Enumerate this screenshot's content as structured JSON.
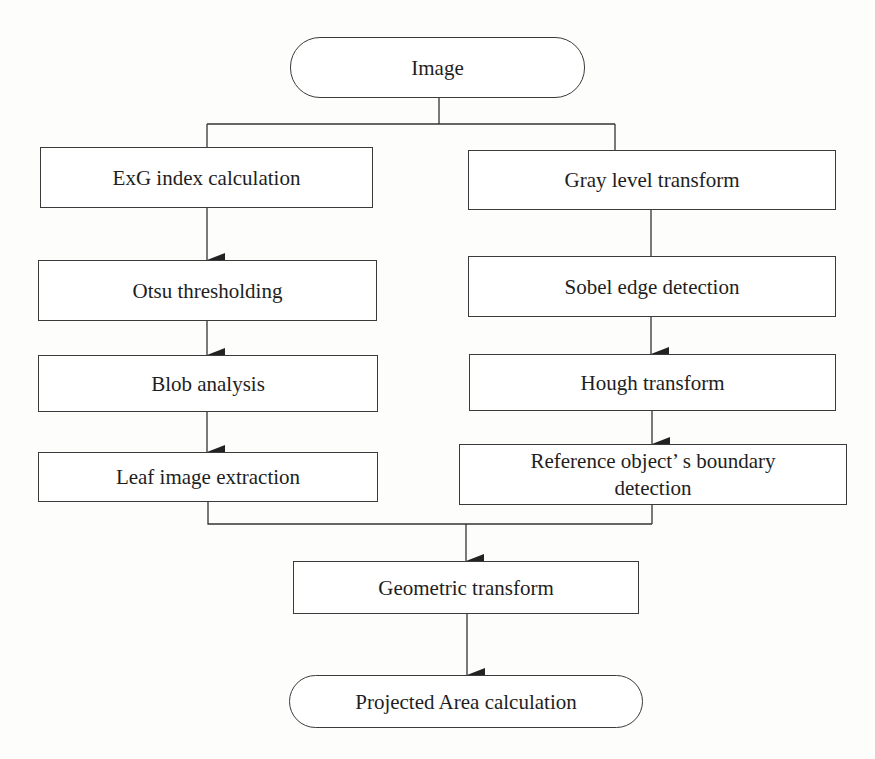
{
  "diagram": {
    "type": "flowchart",
    "nodes": {
      "image": {
        "label": "Image",
        "shape": "terminal"
      },
      "exg": {
        "label": "ExG index calculation",
        "shape": "process"
      },
      "otsu": {
        "label": "Otsu thresholding",
        "shape": "process"
      },
      "blob": {
        "label": "Blob analysis",
        "shape": "process"
      },
      "leaf": {
        "label": "Leaf image extraction",
        "shape": "process"
      },
      "gray": {
        "label": "Gray level transform",
        "shape": "process"
      },
      "sobel": {
        "label": "Sobel edge detection",
        "shape": "process"
      },
      "hough": {
        "label": "Hough transform",
        "shape": "process"
      },
      "reference_line1": {
        "label": "Reference object’ s boundary",
        "shape": "process"
      },
      "reference_line2": {
        "label": "detection",
        "shape": "process"
      },
      "geometric": {
        "label": "Geometric transform",
        "shape": "process"
      },
      "projected": {
        "label": "Projected Area calculation",
        "shape": "terminal"
      }
    },
    "edges": [
      {
        "from": "Image",
        "to": "ExG index calculation",
        "arrow": false
      },
      {
        "from": "Image",
        "to": "Gray level transform",
        "arrow": false
      },
      {
        "from": "ExG index calculation",
        "to": "Otsu thresholding",
        "arrow": true
      },
      {
        "from": "Otsu thresholding",
        "to": "Blob analysis",
        "arrow": true
      },
      {
        "from": "Blob analysis",
        "to": "Leaf image extraction",
        "arrow": true
      },
      {
        "from": "Gray level transform",
        "to": "Sobel edge detection",
        "arrow": false
      },
      {
        "from": "Sobel edge detection",
        "to": "Hough transform",
        "arrow": true
      },
      {
        "from": "Hough transform",
        "to": "Reference object’ s boundary detection",
        "arrow": true
      },
      {
        "from": "Leaf image extraction",
        "to": "Geometric transform",
        "arrow": true
      },
      {
        "from": "Reference object’ s boundary detection",
        "to": "Geometric transform",
        "arrow": true
      },
      {
        "from": "Geometric transform",
        "to": "Projected Area calculation",
        "arrow": true
      }
    ],
    "colors": {
      "line": "#333333",
      "box_border": "#3a3a3a",
      "background": "#fdfdfc",
      "text": "#1e1e1e"
    }
  }
}
